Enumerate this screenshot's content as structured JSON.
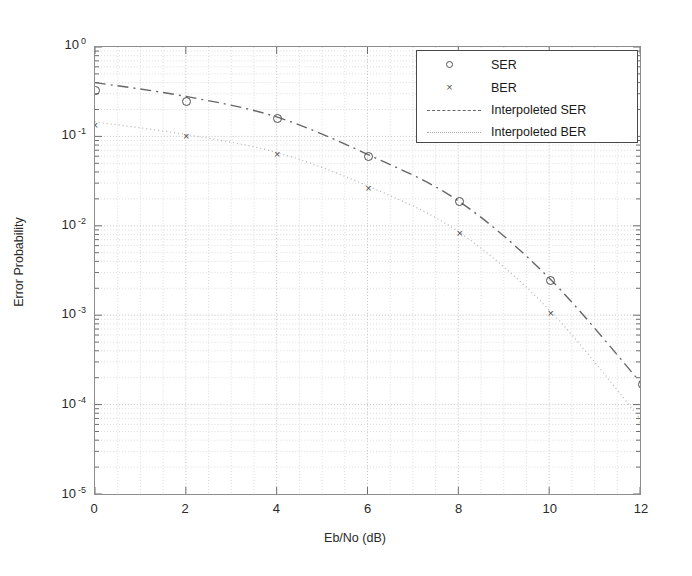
{
  "figure": {
    "background_color": "#ffffff",
    "axes_color": "#8d8d8d",
    "grid_color": "#cfcfcf"
  },
  "chart_data": {
    "type": "line",
    "title": "",
    "xlabel": "Eb/No (dB)",
    "ylabel": "Error Probability",
    "x": [
      0,
      2,
      4,
      6,
      8,
      10,
      12
    ],
    "xlim": [
      0,
      12
    ],
    "xticks": [
      0,
      2,
      4,
      6,
      8,
      10,
      12
    ],
    "xtick_labels": [
      "0",
      "2",
      "4",
      "6",
      "8",
      "10",
      "12"
    ],
    "yscale": "log",
    "ylim": [
      1e-05,
      1
    ],
    "yticks": [
      1,
      0.1,
      0.01,
      0.001,
      0.0001,
      1e-05
    ],
    "ytick_labels": [
      "10 0",
      "10 -1",
      "10 -2",
      "10 -3",
      "10 -4",
      "10 -5"
    ],
    "ytick_mantissa": "10",
    "ytick_exponents": [
      "0",
      "-1",
      "-2",
      "-3",
      "-4",
      "-5"
    ],
    "grid": true,
    "grid_minor": true,
    "legend_position": "upper right",
    "series": [
      {
        "name": "SER",
        "style": "markers",
        "marker": "circle",
        "color": "#4d4d4d",
        "values": [
          0.33,
          0.25,
          0.158,
          0.061,
          0.019,
          0.0025,
          0.000175
        ]
      },
      {
        "name": "BER",
        "style": "markers",
        "marker": "cross",
        "color": "#4d4d4d",
        "values": [
          0.135,
          0.102,
          0.064,
          0.027,
          0.0085,
          0.0011,
          7e-05
        ]
      },
      {
        "name": "Interpoleted SER",
        "style": "dash-dot-line",
        "color": "#666666",
        "values": [
          0.4,
          0.28,
          0.165,
          0.063,
          0.019,
          0.0026,
          0.00018
        ]
      },
      {
        "name": "Interpoleted BER",
        "style": "dotted-line",
        "color": "#b0b0b0",
        "values": [
          0.145,
          0.105,
          0.066,
          0.028,
          0.0086,
          0.00115,
          7e-05
        ]
      }
    ]
  },
  "legend": {
    "entries": [
      {
        "label": "SER",
        "key": "circle-marker"
      },
      {
        "label": "BER",
        "key": "cross-marker"
      },
      {
        "label": "Interpoleted SER",
        "key": "dash-dot-line"
      },
      {
        "label": "Interpoleted BER",
        "key": "dotted-line"
      }
    ]
  }
}
